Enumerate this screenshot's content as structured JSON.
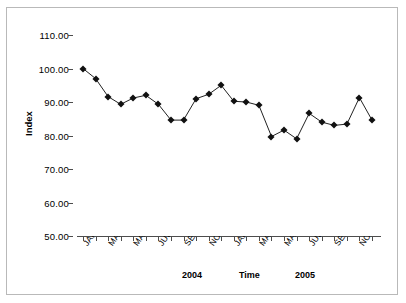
{
  "chart_data": {
    "type": "line",
    "title": "",
    "xlabel": "Time",
    "ylabel": "Index",
    "ylim": [
      50.0,
      110.0
    ],
    "ytick_step": 10.0,
    "ytick_labels": [
      "110.00",
      "100.00",
      "90.00",
      "80.00",
      "70.00",
      "60.00",
      "50.00"
    ],
    "ytick_values": [
      110.0,
      100.0,
      90.0,
      80.0,
      70.0,
      60.0,
      50.0
    ],
    "grid": false,
    "legend": false,
    "marker": "diamond",
    "line_color": "#222222",
    "marker_color": "#111111",
    "x_period_labels": [
      "2004",
      "2005"
    ],
    "x_tick_labels": [
      "JAN",
      "",
      "MAR",
      "",
      "MAY",
      "",
      "JUL",
      "",
      "SEP",
      "",
      "NOV",
      "",
      "JAN",
      "",
      "MAR",
      "",
      "MAY",
      "",
      "JUL",
      "",
      "SEP",
      "",
      "NOV",
      ""
    ],
    "categories": [
      "JAN 2004",
      "FEB 2004",
      "MAR 2004",
      "APR 2004",
      "MAY 2004",
      "JUN 2004",
      "JUL 2004",
      "AUG 2004",
      "SEP 2004",
      "OCT 2004",
      "NOV 2004",
      "DEC 2004",
      "JAN 2005",
      "FEB 2005",
      "MAR 2005",
      "APR 2005",
      "MAY 2005",
      "JUN 2005",
      "JUL 2005",
      "AUG 2005",
      "SEP 2005",
      "OCT 2005",
      "NOV 2005",
      "DEC 2005"
    ],
    "values": [
      100.0,
      97.0,
      91.6,
      89.3,
      91.2,
      92.0,
      89.3,
      84.6,
      84.6,
      91.0,
      92.3,
      95.0,
      90.2,
      90.0,
      89.0,
      79.7,
      81.6,
      79.0,
      86.6,
      84.0,
      83.0,
      83.4,
      91.3,
      84.6
    ]
  }
}
